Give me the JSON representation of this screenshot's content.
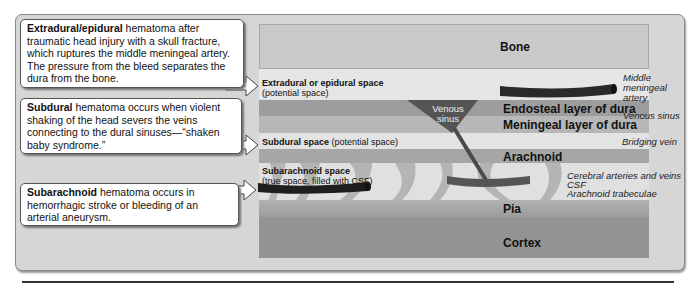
{
  "callouts": [
    {
      "term": "Extradural/epidural",
      "text": " hematoma after traumatic head injury with a skull fracture, which ruptures the middle meningeal artery. The pressure from the bleed separates the dura from the bone."
    },
    {
      "term": "Subdural",
      "text": " hematoma occurs when violent shaking of the head severs the veins connecting to the dural sinuses—“shaken baby syndrome.”"
    },
    {
      "term": "Subarachnoid",
      "text": " hematoma occurs in hemorrhagic stroke or bleeding of an arterial aneurysm."
    }
  ],
  "layers": {
    "bone": "Bone",
    "endosteal": "Endosteal layer of dura",
    "meningeal": "Meningeal layer of dura",
    "arachnoid": "Arachnoid",
    "pia": "Pia",
    "cortex": "Cortex"
  },
  "spaces": {
    "epidural": {
      "name": "Extradural or epidural space",
      "note": "(potential space)"
    },
    "subdural": {
      "name": "Subdural space",
      "note": " (potential space)"
    },
    "subarachnoid": {
      "name": "Subarachnoid space",
      "note": "(true space, filled with CSF)"
    }
  },
  "structures": {
    "venous_sinus_inner": "Venous sinus",
    "middle_meningeal_artery": "Middle meningeal artery",
    "venous_sinus": "Venous sinus",
    "bridging_vein": "Bridging vein",
    "cerebral_vessels": "Cerebral arteries and veins",
    "csf": "CSF",
    "arachnoid_trabeculae": "Arachnoid trabeculae"
  }
}
